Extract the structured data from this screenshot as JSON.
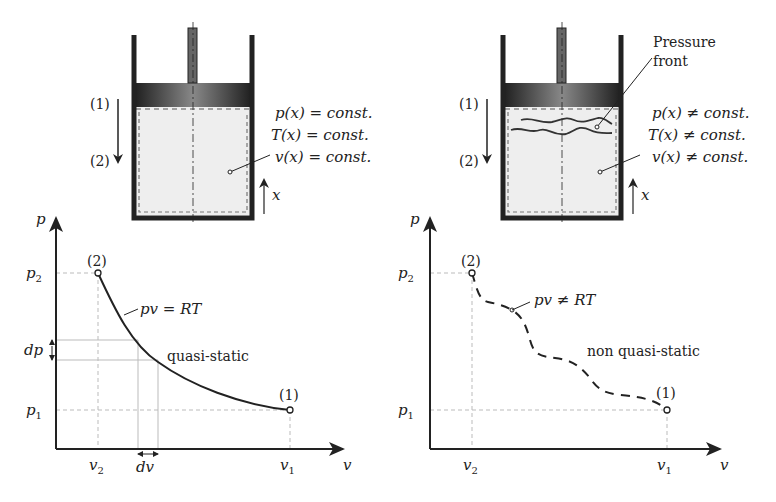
{
  "left_panel": {
    "cylinder": {
      "state_labels": {
        "start": "(1)",
        "end": "(2)"
      },
      "properties": [
        "p(x) = const.",
        "T(x) = const.",
        "v(x) = const."
      ],
      "axis_label": "x"
    },
    "plot": {
      "y_axis_label": "p",
      "x_axis_label": "v",
      "y_ticks": {
        "p2": "p",
        "p2_sub": "2",
        "p1": "p",
        "p1_sub": "1",
        "dp": "dp"
      },
      "x_ticks": {
        "v2": "v",
        "v2_sub": "2",
        "v1": "v",
        "v1_sub": "1",
        "dv": "dv"
      },
      "point_labels": {
        "start": "(1)",
        "end": "(2)"
      },
      "curve_label": "pv = RT",
      "process_label": "quasi-static"
    }
  },
  "right_panel": {
    "cylinder": {
      "state_labels": {
        "start": "(1)",
        "end": "(2)"
      },
      "front_label_line1": "Pressure",
      "front_label_line2": "front",
      "properties": [
        "p(x) ≠ const.",
        "T(x) ≠ const.",
        "v(x) ≠ const."
      ],
      "axis_label": "x"
    },
    "plot": {
      "y_axis_label": "p",
      "x_axis_label": "v",
      "y_ticks": {
        "p2": "p",
        "p2_sub": "2",
        "p1": "p",
        "p1_sub": "1"
      },
      "x_ticks": {
        "v2": "v",
        "v2_sub": "2",
        "v1": "v",
        "v1_sub": "1"
      },
      "point_labels": {
        "start": "(1)",
        "end": "(2)"
      },
      "curve_label": "pv ≠ RT",
      "process_label": "non quasi-static"
    }
  },
  "colors": {
    "ink": "#222222",
    "gas_fill": "#eeeeee",
    "guide": "#bbbbbb",
    "piston_dark": "#2a2a2a",
    "piston_light": "#8a8a8a"
  }
}
